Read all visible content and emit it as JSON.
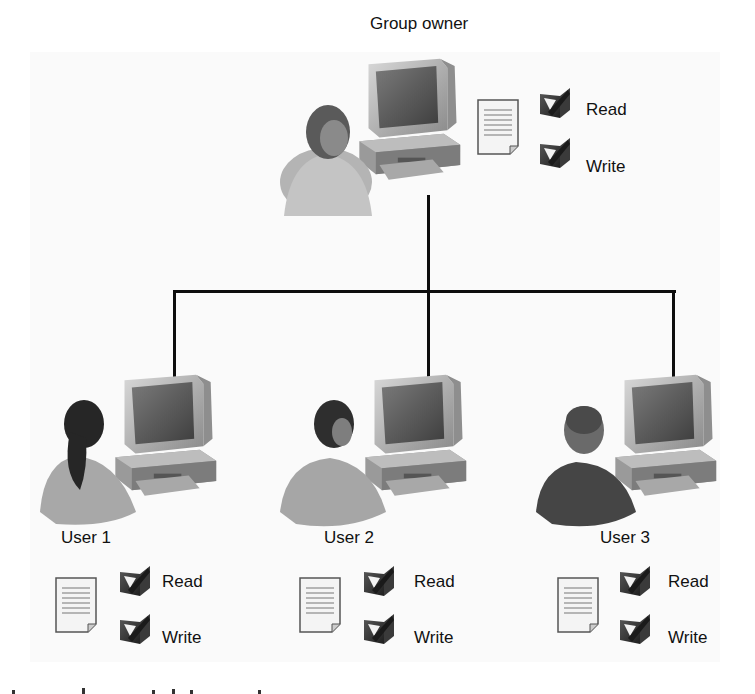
{
  "diagram": {
    "type": "hierarchy",
    "colors": {
      "line": "#0d0d0d",
      "background": "#ffffff",
      "panel": "#fafafa",
      "checkbox": "#2a2a2a"
    },
    "owner": {
      "label": "Group owner",
      "icon": "person-at-computer-icon",
      "document_icon": "document-icon",
      "permissions": [
        {
          "label": "Read",
          "checked": true,
          "icon": "checkbox-checked-icon"
        },
        {
          "label": "Write",
          "checked": true,
          "icon": "checkbox-checked-icon"
        }
      ]
    },
    "users": [
      {
        "label": "User 1",
        "icon": "person-at-computer-icon",
        "document_icon": "document-icon",
        "permissions": [
          {
            "label": "Read",
            "checked": true,
            "icon": "checkbox-checked-icon"
          },
          {
            "label": "Write",
            "checked": true,
            "icon": "checkbox-checked-icon"
          }
        ]
      },
      {
        "label": "User 2",
        "icon": "person-at-computer-icon",
        "document_icon": "document-icon",
        "permissions": [
          {
            "label": "Read",
            "checked": true,
            "icon": "checkbox-checked-icon"
          },
          {
            "label": "Write",
            "checked": true,
            "icon": "checkbox-checked-icon"
          }
        ]
      },
      {
        "label": "User 3",
        "icon": "person-at-computer-icon",
        "document_icon": "document-icon",
        "permissions": [
          {
            "label": "Read",
            "checked": true,
            "icon": "checkbox-checked-icon"
          },
          {
            "label": "Write",
            "checked": true,
            "icon": "checkbox-checked-icon"
          }
        ]
      }
    ]
  }
}
